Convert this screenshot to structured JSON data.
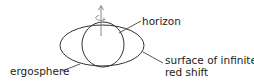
{
  "diagram": {
    "labels": {
      "horizon": "horizon",
      "surface_line1": "surface of infinite",
      "surface_line2": "red shift",
      "ergosphere": "ergosphere"
    },
    "colors": {
      "stroke": "#333333",
      "arrow": "#888888",
      "text": "#222222",
      "background": "#ffffff"
    }
  }
}
